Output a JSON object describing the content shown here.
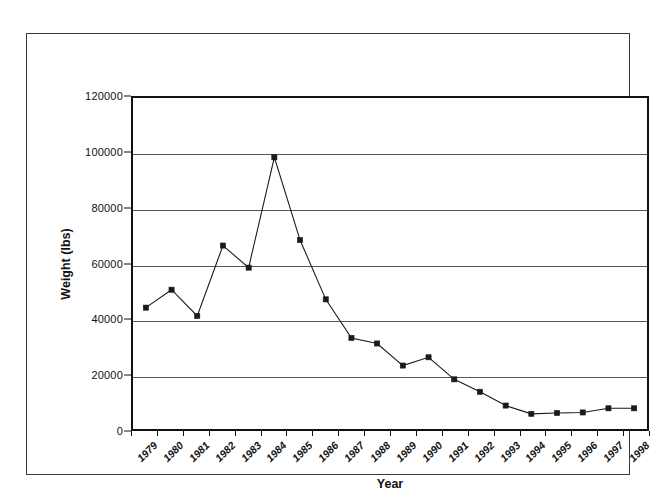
{
  "chart_data": {
    "type": "line",
    "title": "",
    "xlabel": "Year",
    "ylabel": "Weight (lbs)",
    "categories": [
      "1979",
      "1980",
      "1981",
      "1982",
      "1983",
      "1984",
      "1985",
      "1986",
      "1987",
      "1988",
      "1989",
      "1990",
      "1991",
      "1992",
      "1993",
      "1994",
      "1995",
      "1996",
      "1997",
      "1998"
    ],
    "values": [
      44000,
      50500,
      41000,
      66500,
      58500,
      98500,
      68500,
      47000,
      33000,
      31000,
      23000,
      26000,
      18000,
      13500,
      8500,
      5500,
      5800,
      6000,
      7500,
      7500
    ],
    "series": [
      {
        "name": "Weight (lbs)",
        "values": [
          44000,
          50500,
          41000,
          66500,
          58500,
          98500,
          68500,
          47000,
          33000,
          31000,
          23000,
          26000,
          18000,
          13500,
          8500,
          5500,
          5800,
          6000,
          7500,
          7500
        ]
      }
    ],
    "ylim": [
      0,
      120000
    ],
    "yticks": [
      0,
      20000,
      40000,
      60000,
      80000,
      100000,
      120000
    ],
    "ytick_labels": [
      "0",
      "20000",
      "40000",
      "60000",
      "80000",
      "100000",
      "120000"
    ],
    "grid": "horizontal",
    "legend": "none",
    "marker": "square",
    "line_color": "#1a1a1a",
    "marker_color": "#1a1a1a",
    "grid_color": "#555555",
    "xtick_rotation": -45
  }
}
